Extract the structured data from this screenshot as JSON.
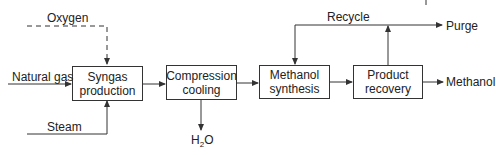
{
  "diagram": {
    "type": "process-flow",
    "title": "",
    "colors": {
      "line": "#333333",
      "text": "#222222",
      "background": "#ffffff"
    },
    "blocks": [
      {
        "id": "syngas",
        "label": "Syngas\nproduction"
      },
      {
        "id": "compression",
        "label": "Compression\ncooling"
      },
      {
        "id": "synthesis",
        "label": "Methanol\nsynthesis"
      },
      {
        "id": "recovery",
        "label": "Product\nrecovery"
      }
    ],
    "streams": {
      "oxygen": "Oxygen",
      "natural_gas": "Natural gas",
      "steam": "Steam",
      "water_pre": "H",
      "water_sub": "2",
      "water_post": "O",
      "recycle": "Recycle",
      "purge": "Purge",
      "methanol": "Methanol"
    },
    "edges": [
      {
        "from": "Oxygen",
        "to": "syngas",
        "style": "dashed"
      },
      {
        "from": "Natural gas",
        "to": "syngas",
        "style": "solid"
      },
      {
        "from": "Steam",
        "to": "syngas",
        "style": "solid"
      },
      {
        "from": "syngas",
        "to": "compression",
        "style": "solid"
      },
      {
        "from": "compression",
        "to": "H2O",
        "style": "solid"
      },
      {
        "from": "compression",
        "to": "synthesis",
        "style": "solid"
      },
      {
        "from": "synthesis",
        "to": "recovery",
        "style": "solid"
      },
      {
        "from": "recovery",
        "to": "Purge",
        "style": "solid"
      },
      {
        "from": "recovery",
        "to": "synthesis",
        "label": "Recycle",
        "style": "solid"
      },
      {
        "from": "recovery",
        "to": "Methanol",
        "style": "solid"
      }
    ]
  }
}
